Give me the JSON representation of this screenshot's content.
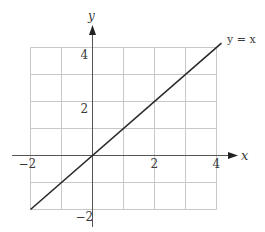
{
  "chart_data": {
    "type": "line",
    "title": "",
    "xlabel": "x",
    "ylabel": "y",
    "xlim": [
      -2,
      4
    ],
    "ylim": [
      -2,
      4
    ],
    "grid": true,
    "grid_step": 1,
    "x_ticks": [
      {
        "value": -2,
        "label": "−2"
      },
      {
        "value": 2,
        "label": "2"
      },
      {
        "value": 4,
        "label": "4"
      }
    ],
    "y_ticks": [
      {
        "value": 4,
        "label": "4"
      },
      {
        "value": 2,
        "label": "2"
      },
      {
        "value": -2,
        "label": "−2"
      }
    ],
    "series": [
      {
        "name": "y = x",
        "x": [
          -2,
          4.16
        ],
        "y": [
          -2,
          4.16
        ]
      }
    ],
    "annotations": [
      {
        "text": "y = x",
        "at": [
          4.16,
          4.16
        ]
      }
    ]
  },
  "labels": {
    "x_axis": "x",
    "y_axis": "y",
    "line": "y = x"
  },
  "colors": {
    "grid": "#c8c8c8",
    "axis": "#555555",
    "line": "#2a2a2a",
    "text": "#3a3a3a"
  }
}
